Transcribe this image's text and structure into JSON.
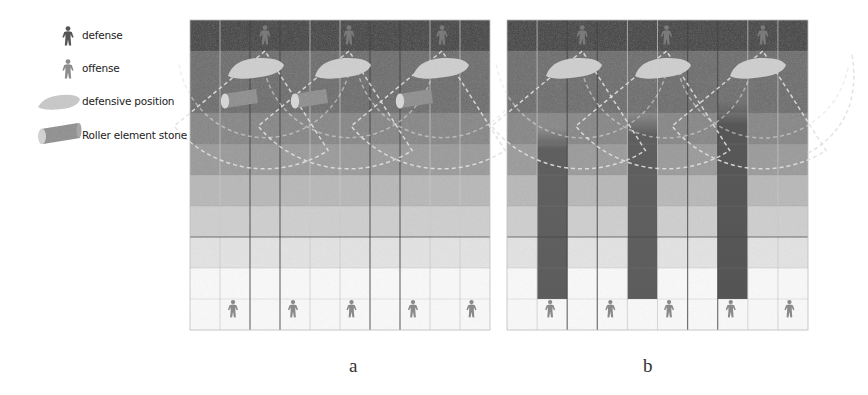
{
  "legend": {
    "items": [
      {
        "icon": "defense-figure-icon",
        "label": "defense",
        "color": "#555555"
      },
      {
        "icon": "offense-figure-icon",
        "label": "offense",
        "color": "#8c8c8c"
      },
      {
        "icon": "defensive-position-icon",
        "label": "defensive position",
        "color": "#c8c8c8"
      },
      {
        "icon": "roller-stone-icon",
        "label": "Roller element stone",
        "color": "#9a9a9a"
      }
    ]
  },
  "grid": {
    "rows": 10,
    "cols": 10,
    "row_bands": [
      "#3c3c3c",
      "#6b6b6b",
      "#6b6b6b",
      "#858585",
      "#9a9a9a",
      "#b8b8b8",
      "#cfcfcf",
      "#e4e4e4",
      "#fbfbfb",
      "#fbfbfb"
    ],
    "thin_line_color": "#c9c9c9",
    "dark_line_color": "#444444"
  },
  "panels": [
    {
      "id": "a",
      "label": "a",
      "x": 190,
      "y": 20,
      "w": 300,
      "h": 310,
      "dark_vlines": [
        2,
        3,
        6,
        7
      ],
      "dark_hlines": [
        7
      ],
      "defense_figures": [
        {
          "col": 2.5
        },
        {
          "col": 5.3
        },
        {
          "col": 8.4
        }
      ],
      "defensive_positions": [
        {
          "cx": 65,
          "cy": 48
        },
        {
          "cx": 152,
          "cy": 48
        },
        {
          "cx": 250,
          "cy": 48
        }
      ],
      "rollers": [
        {
          "cx": 50,
          "cy": 80
        },
        {
          "cx": 120,
          "cy": 80
        },
        {
          "cx": 225,
          "cy": 80
        }
      ],
      "offense_figures": [
        {
          "col": 1.45
        },
        {
          "col": 3.45
        },
        {
          "col": 5.4
        },
        {
          "col": 7.45
        },
        {
          "col": 9.4
        }
      ],
      "dark_columns": []
    },
    {
      "id": "b",
      "label": "b",
      "x": 507,
      "y": 20,
      "w": 301,
      "h": 310,
      "dark_vlines": [
        2,
        3,
        6,
        7
      ],
      "dark_hlines": [
        7
      ],
      "defense_figures": [
        {
          "col": 2.5
        },
        {
          "col": 5.3
        },
        {
          "col": 8.5
        }
      ],
      "defensive_positions": [
        {
          "cx": 66,
          "cy": 48
        },
        {
          "cx": 155,
          "cy": 48
        },
        {
          "cx": 250,
          "cy": 48
        }
      ],
      "rollers": [],
      "offense_figures": [
        {
          "col": 1.45
        },
        {
          "col": 3.45
        },
        {
          "col": 5.4
        },
        {
          "col": 7.45
        },
        {
          "col": 9.4
        }
      ],
      "dark_columns": [
        {
          "col": 1,
          "top_row": 3.5,
          "bottom_row": 9.0,
          "color": "#5c5c5c"
        },
        {
          "col": 4,
          "top_row": 3.0,
          "bottom_row": 9.0,
          "color": "#5c5c5c"
        },
        {
          "col": 7,
          "top_row": 2.6,
          "bottom_row": 9.0,
          "color": "#545454"
        }
      ]
    }
  ],
  "colors": {
    "defense_figure": "#7a7a7a",
    "offense_figure": "#8a8a8a",
    "defensive_position": "#cfcfcf",
    "roller": "#8d8d8d",
    "roller_end": "#d8d8d8",
    "dashed_arc": "#e0e0e0"
  }
}
